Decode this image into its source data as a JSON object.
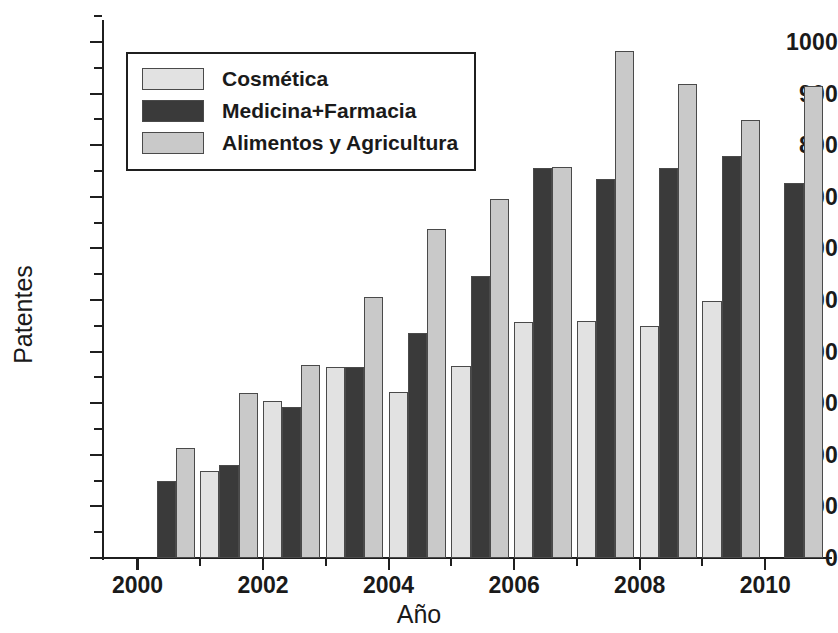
{
  "chart_data": {
    "type": "bar",
    "title": "",
    "xlabel": "Año",
    "ylabel": "Patentes",
    "xlim": [
      1999.45,
      2011.0
    ],
    "ylim": [
      0,
      1000
    ],
    "ytick_step": 100,
    "yminor_step": 50,
    "grid": false,
    "legend_position": "upper left",
    "categories": [
      2000,
      2001,
      2002,
      2003,
      2004,
      2005,
      2006,
      2007,
      2008,
      2009,
      2010
    ],
    "xtick_labels": [
      "2000",
      "2002",
      "2004",
      "2006",
      "2008",
      "2010"
    ],
    "xtick_values": [
      2000,
      2002,
      2004,
      2006,
      2008,
      2010
    ],
    "xminor_values": [
      2001,
      2003,
      2005,
      2007,
      2009
    ],
    "ytick_labels": [
      "0",
      "100",
      "200",
      "300",
      "400",
      "500",
      "600",
      "700",
      "800",
      "900",
      "1000"
    ],
    "series": [
      {
        "name": "Cosmética",
        "color": "#e2e2e2",
        "values": [
          null,
          168,
          305,
          370,
          322,
          372,
          458,
          460,
          450,
          498,
          null
        ]
      },
      {
        "name": "Medicina+Farmacia",
        "color": "#3a3a3a",
        "values": [
          150,
          180,
          293,
          371,
          436,
          546,
          756,
          735,
          756,
          779,
          726
        ]
      },
      {
        "name": "Alimentos y Agricultura",
        "color": "#c9c9c9",
        "values": [
          213,
          320,
          375,
          505,
          637,
          696,
          757,
          983,
          918,
          848,
          914
        ]
      }
    ]
  },
  "legend": {
    "items": [
      {
        "label": "Cosmética",
        "color": "#e2e2e2"
      },
      {
        "label": "Medicina+Farmacia",
        "color": "#3a3a3a"
      },
      {
        "label": "Alimentos y Agricultura",
        "color": "#c9c9c9"
      }
    ]
  }
}
